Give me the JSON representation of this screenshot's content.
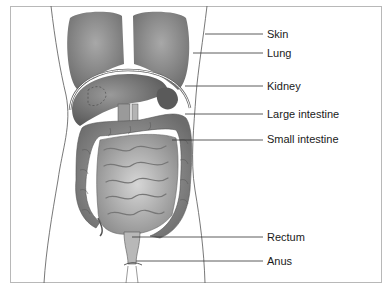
{
  "diagram": {
    "type": "anatomical illustration",
    "labels": [
      {
        "id": "skin",
        "text": "Skin",
        "y": 33,
        "line_from_x": 205
      },
      {
        "id": "lung",
        "text": "Lung",
        "y": 52,
        "line_from_x": 193
      },
      {
        "id": "kidney",
        "text": "Kidney",
        "y": 85,
        "line_from_x": 185
      },
      {
        "id": "large-intestine",
        "text": "Large intestine",
        "y": 113,
        "line_from_x": 185
      },
      {
        "id": "small-intestine",
        "text": "Small intestine",
        "y": 139,
        "line_from_x": 172
      },
      {
        "id": "rectum",
        "text": "Rectum",
        "y": 236,
        "line_from_x": 132
      },
      {
        "id": "anus",
        "text": "Anus",
        "y": 260,
        "line_from_x": 136
      }
    ],
    "colors": {
      "border": "#b8b8b8",
      "organ_dark": "#6e6e6e",
      "organ_mid": "#9a9a9a",
      "organ_light": "#c8c8c8",
      "outline": "#444444",
      "leader_line": "#333333"
    }
  }
}
